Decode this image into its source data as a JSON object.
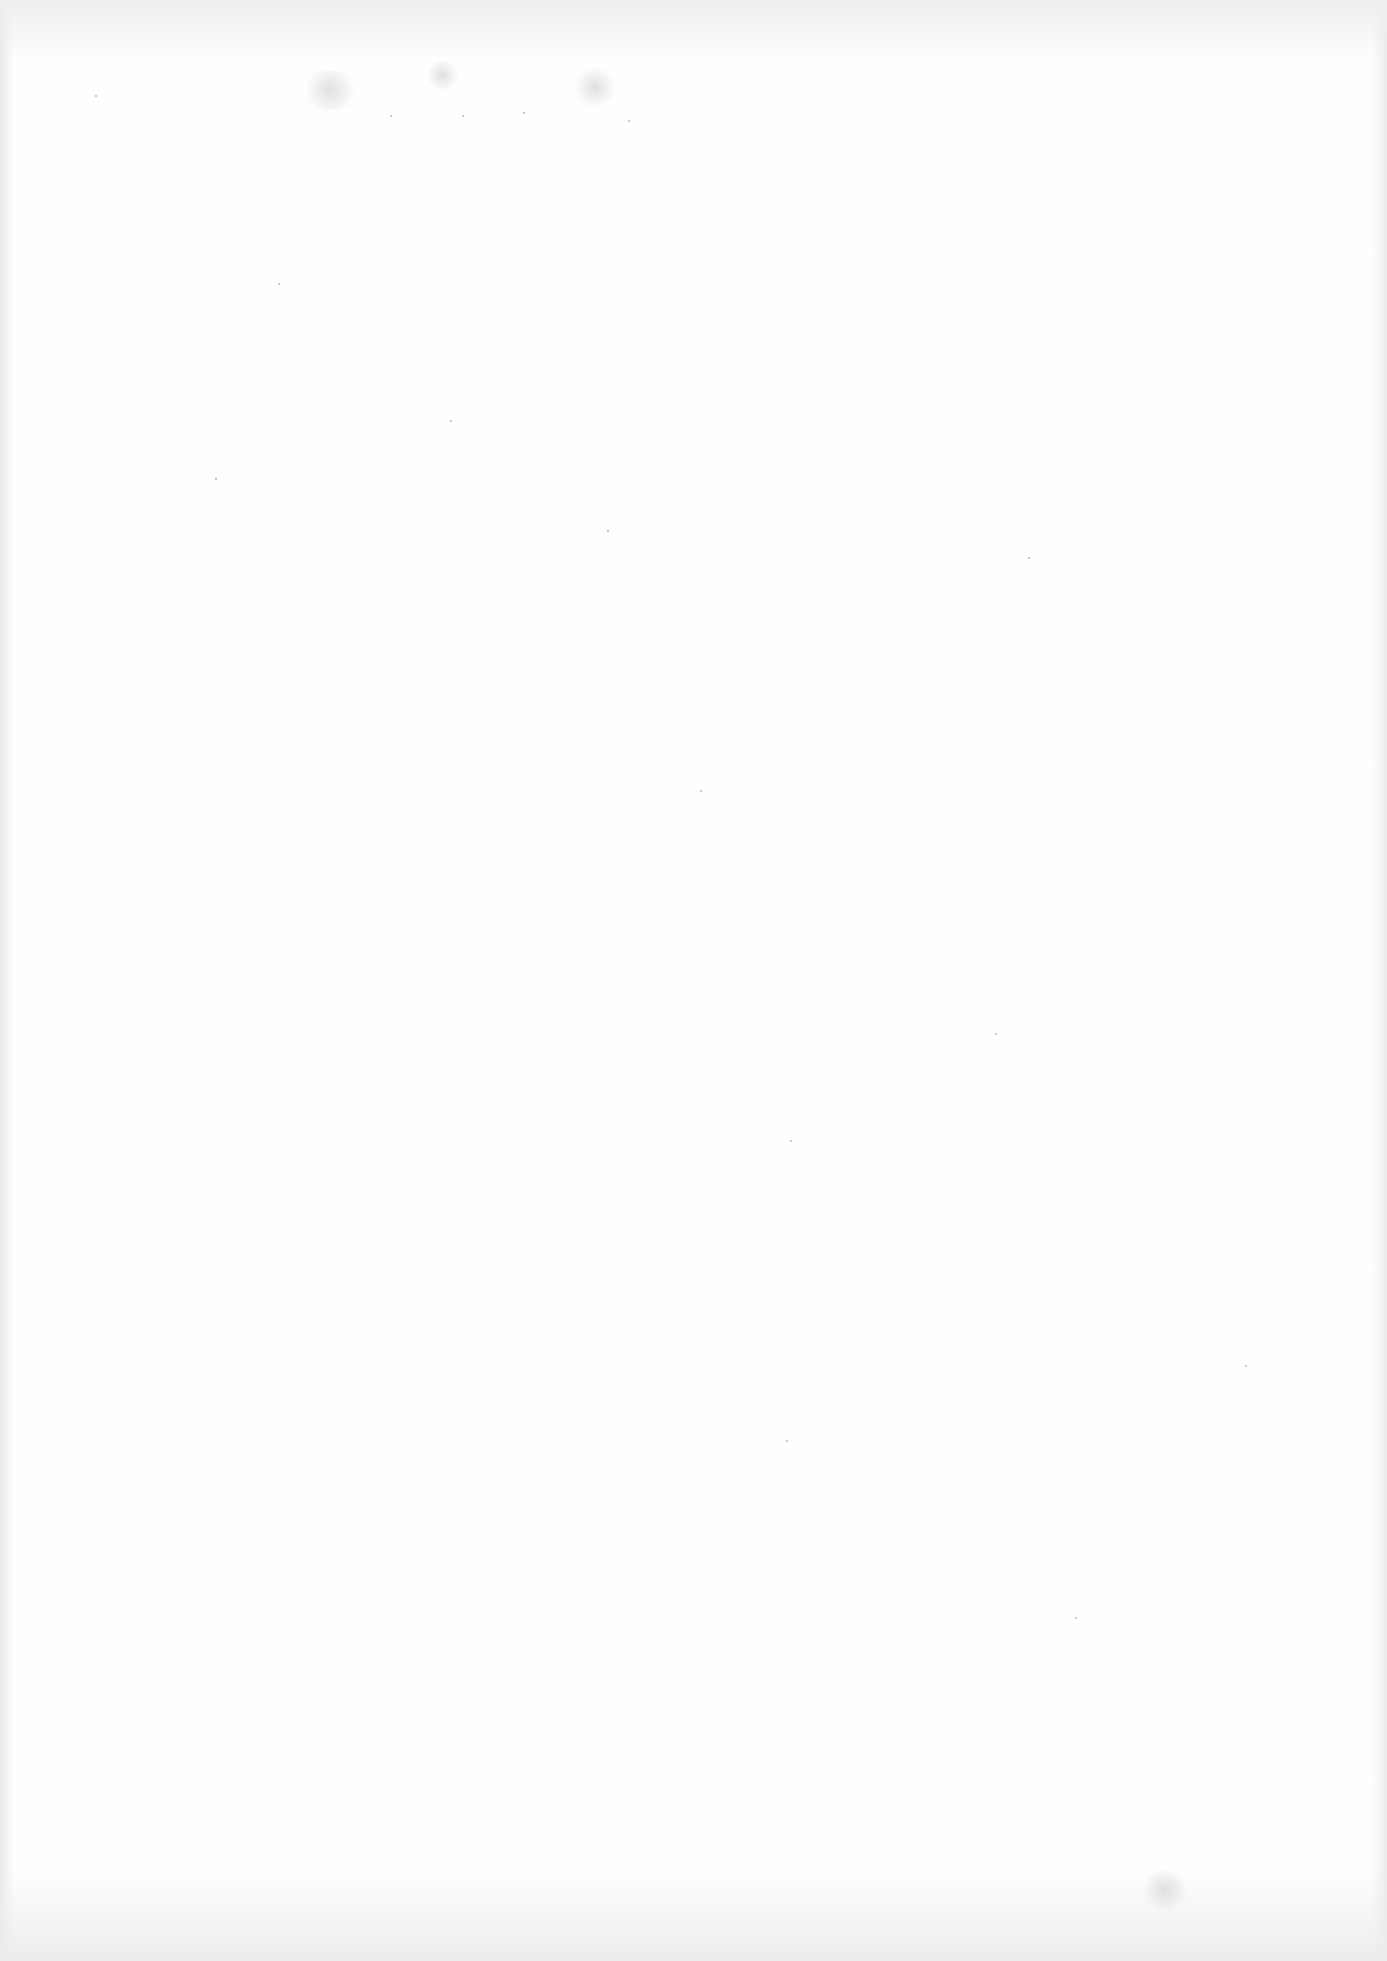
{
  "document": {
    "type": "scanned-page",
    "content": "",
    "background_color": "#fefefe"
  },
  "artifacts": {
    "smudges": [
      {
        "x": 300,
        "y": 70,
        "w": 60,
        "h": 40
      },
      {
        "x": 425,
        "y": 60,
        "w": 35,
        "h": 30
      },
      {
        "x": 575,
        "y": 65,
        "w": 40,
        "h": 45
      },
      {
        "x": 1140,
        "y": 1870,
        "w": 50,
        "h": 40
      }
    ],
    "specks": [
      [
        95,
        95
      ],
      [
        278,
        283
      ],
      [
        390,
        115
      ],
      [
        462,
        115
      ],
      [
        523,
        112
      ],
      [
        628,
        120
      ],
      [
        1028,
        557
      ],
      [
        995,
        1033
      ],
      [
        786,
        1440
      ],
      [
        1075,
        1617
      ],
      [
        1245,
        1365
      ],
      [
        790,
        1140
      ],
      [
        607,
        530
      ],
      [
        450,
        420
      ],
      [
        700,
        790
      ],
      [
        215,
        478
      ]
    ]
  }
}
